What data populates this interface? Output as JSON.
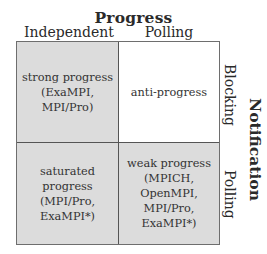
{
  "diagram": {
    "top_axis": {
      "title": "Progress",
      "columns": [
        "Independent",
        "Polling"
      ]
    },
    "side_axis": {
      "title": "Notification",
      "rows": [
        "Blocking",
        "Polling"
      ]
    },
    "cells": [
      {
        "row": "Blocking",
        "col": "Independent",
        "text": "strong progress\n(ExaMPI,\nMPI/Pro)",
        "shaded": true
      },
      {
        "row": "Blocking",
        "col": "Polling",
        "text": "anti-progress",
        "shaded": false
      },
      {
        "row": "Polling",
        "col": "Independent",
        "text": "saturated progress\n(MPI/Pro,\nExaMPI*)",
        "shaded": true
      },
      {
        "row": "Polling",
        "col": "Polling",
        "text": "weak progress\n(MPICH,\nOpenMPI,\nMPI/Pro,\nExaMPI*)",
        "shaded": true
      }
    ],
    "colors": {
      "shaded": "#dcdcdc",
      "unshaded": "#ffffff",
      "lines": "#555555"
    }
  }
}
